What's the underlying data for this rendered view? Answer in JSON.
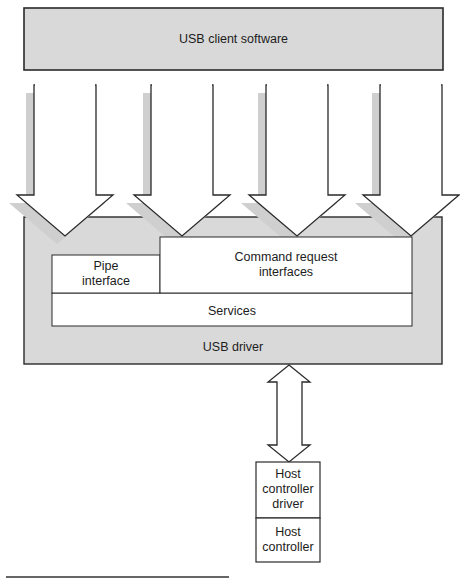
{
  "diagram": {
    "client_software": {
      "label": "USB client software"
    },
    "usb_driver": {
      "label": "USB driver",
      "pipe_interface": {
        "label_line1": "Pipe",
        "label_line2": "interface"
      },
      "command_request": {
        "label_line1": "Command request",
        "label_line2": "interfaces"
      },
      "services": {
        "label": "Services"
      }
    },
    "host_controller_driver": {
      "label_line1": "Host",
      "label_line2": "controller",
      "label_line3": "driver"
    },
    "host_controller": {
      "label_line1": "Host",
      "label_line2": "controller"
    },
    "arrows_down_count": 4,
    "colors": {
      "box_fill": "#d9d9d9",
      "shadow": "#cfcfcf",
      "stroke": "#2a2a2a",
      "white": "#ffffff"
    }
  }
}
